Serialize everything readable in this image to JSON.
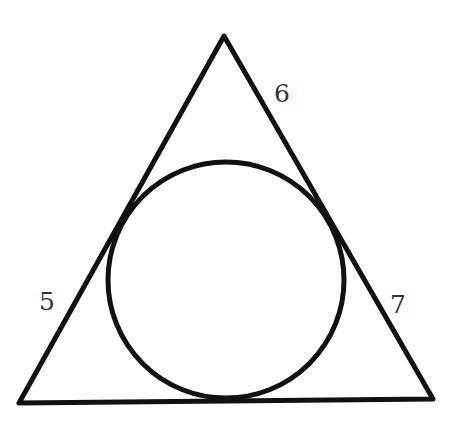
{
  "diagram": {
    "triangle": {
      "vertices": {
        "top": [
          224,
          36
        ],
        "bottom_left": [
          19,
          403
        ],
        "bottom_right": [
          433,
          399
        ]
      },
      "stroke_color": "#111111",
      "stroke_width": 5
    },
    "incircle": {
      "center": [
        226,
        280
      ],
      "radius": 118,
      "stroke_color": "#111111",
      "stroke_width": 5
    },
    "labels": {
      "left_side": {
        "text": "5",
        "x": 39,
        "y": 310
      },
      "right_upper_side": {
        "text": "6",
        "x": 274,
        "y": 102
      },
      "right_lower_side": {
        "text": "7",
        "x": 390,
        "y": 313
      }
    }
  }
}
